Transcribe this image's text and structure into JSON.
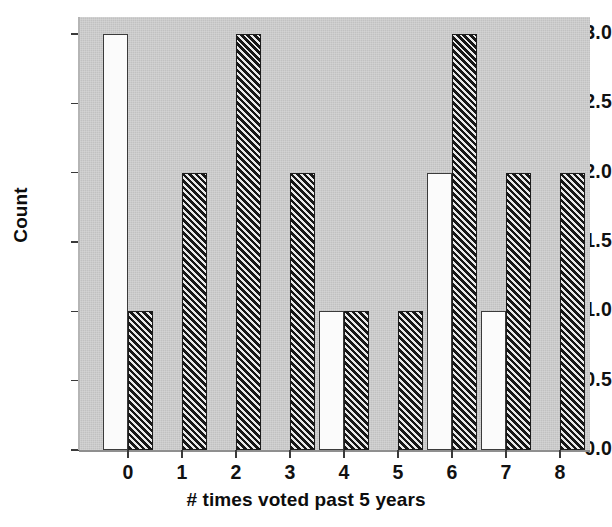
{
  "chart_data": {
    "type": "bar",
    "title": "",
    "xlabel": "# times voted past 5 years",
    "ylabel": "Count",
    "categories": [
      "0",
      "1",
      "2",
      "3",
      "4",
      "5",
      "6",
      "7",
      "8"
    ],
    "series": [
      {
        "name": "white",
        "style": "open-white",
        "values": [
          3,
          0,
          0,
          0,
          1,
          0,
          2,
          1,
          0
        ]
      },
      {
        "name": "hatched",
        "style": "diagonal-hatch",
        "values": [
          1,
          2,
          3,
          2,
          1,
          1,
          3,
          2,
          2
        ]
      }
    ],
    "ylim": [
      0.0,
      3.0
    ],
    "yticks": [
      "0.0",
      "0.5",
      "1.0",
      "1.5",
      "2.0",
      "2.5",
      "3.0"
    ],
    "ytick_values": [
      0.0,
      0.5,
      1.0,
      1.5,
      2.0,
      2.5,
      3.0
    ],
    "xtick_labels": [
      "0",
      "1",
      "2",
      "3",
      "4",
      "5",
      "6",
      "7",
      "8"
    ],
    "grid": false,
    "legend": "none",
    "panel_background": "#c9c9c9",
    "bar_white_fill": "#fbfbfb",
    "bar_hatch_fill": "#1c1c1c"
  },
  "axes": {
    "y_labels": [
      "3.0",
      "2.5",
      "2.0",
      "1.5",
      "1.0",
      "0.5",
      "0.0"
    ],
    "x_labels": [
      "0",
      "1",
      "2",
      "3",
      "4",
      "5",
      "6",
      "7",
      "8"
    ],
    "x_axis_title": "# times voted past 5 years",
    "y_axis_title": "Count"
  }
}
